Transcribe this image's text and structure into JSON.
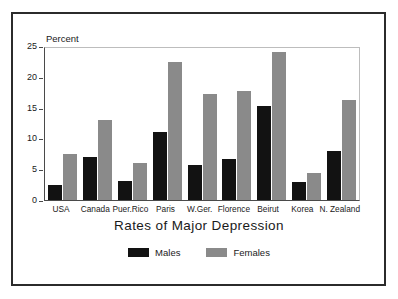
{
  "chart_data": {
    "type": "bar",
    "title": "Rates of Major Depression",
    "xlabel": "",
    "ylabel": "Percent",
    "ylim": [
      0,
      25
    ],
    "yticks": [
      0,
      5,
      10,
      15,
      20,
      25
    ],
    "grid": false,
    "legend_position": "bottom",
    "categories": [
      "USA",
      "Canada",
      "Puer.Rico",
      "Paris",
      "W.Ger.",
      "Florence",
      "Beirut",
      "Korea",
      "N. Zealand"
    ],
    "series": [
      {
        "name": "Males",
        "color": "#121212",
        "values": [
          2.5,
          7.0,
          3.1,
          11.2,
          5.7,
          6.8,
          15.4,
          2.9,
          8.0
        ]
      },
      {
        "name": "Females",
        "color": "#8a8a8a",
        "values": [
          7.5,
          13.2,
          6.1,
          22.7,
          17.4,
          17.9,
          24.4,
          4.4,
          16.5
        ]
      }
    ]
  },
  "axis": {
    "tick_labels": [
      "25",
      "20",
      "15",
      "10",
      "5",
      "0"
    ]
  },
  "legend": {
    "items": [
      {
        "label": "Males"
      },
      {
        "label": "Females"
      }
    ]
  }
}
